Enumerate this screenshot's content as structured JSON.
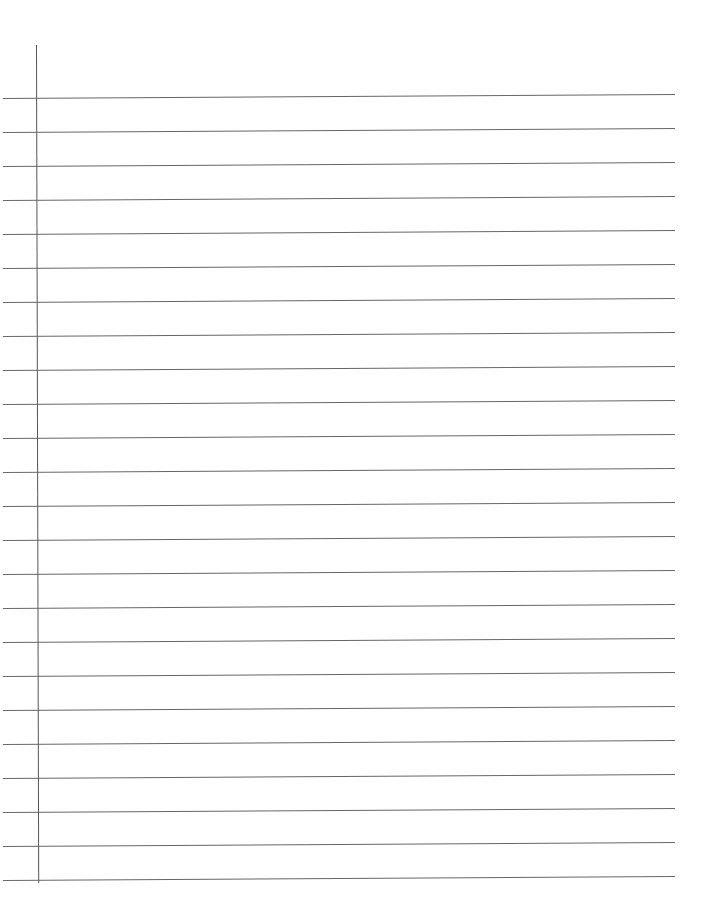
{
  "document": {
    "type": "lined-paper",
    "line_count": 24,
    "first_line_y": 98,
    "line_spacing": 34,
    "margin_x": 36,
    "line_color": "#666666",
    "margin_color": "#555555"
  }
}
